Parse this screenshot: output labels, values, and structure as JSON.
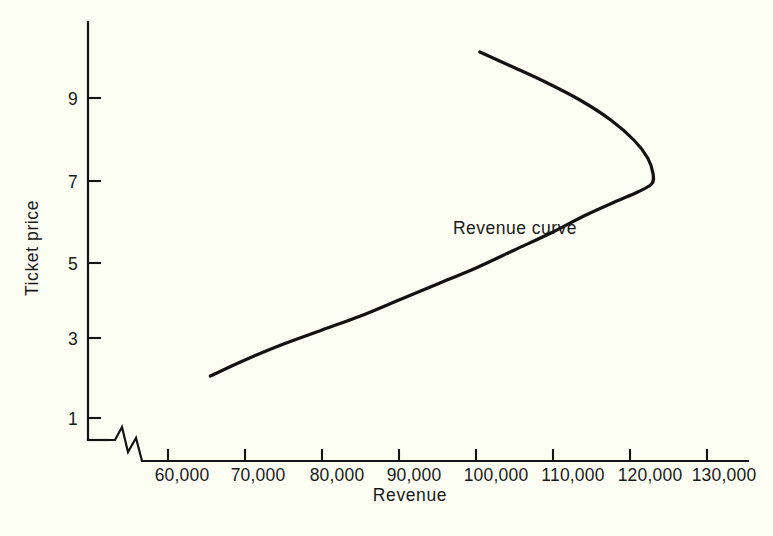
{
  "chart_data": {
    "type": "line",
    "title": "",
    "xlabel": "Revenue",
    "ylabel": "Ticket price",
    "x_tick_labels": [
      "60,000",
      "70,000",
      "80,000",
      "90,000",
      "100,000",
      "110,000",
      "120,000",
      "130,000"
    ],
    "x_tick_values": [
      60000,
      70000,
      80000,
      90000,
      100000,
      110000,
      120000,
      130000
    ],
    "y_tick_labels": [
      "1",
      "3",
      "5",
      "7",
      "9"
    ],
    "y_tick_values": [
      1,
      3,
      5,
      7,
      9
    ],
    "xlim": [
      55000,
      135000
    ],
    "ylim": [
      0,
      10.4
    ],
    "grid": false,
    "legend": false,
    "axis_break": true,
    "axis_break_note": "zigzag break on x-axis between origin and 60,000",
    "annotations": [
      {
        "text": "Revenue curve",
        "x": 97000,
        "y": 5.6
      }
    ],
    "series": [
      {
        "name": "Revenue curve",
        "color": "#141210",
        "orientation": "backward-bending",
        "points": [
          {
            "x": 65500,
            "y": 2.05
          },
          {
            "x": 70000,
            "y": 2.45
          },
          {
            "x": 75000,
            "y": 2.85
          },
          {
            "x": 80000,
            "y": 3.2
          },
          {
            "x": 85000,
            "y": 3.55
          },
          {
            "x": 90000,
            "y": 3.95
          },
          {
            "x": 95000,
            "y": 4.35
          },
          {
            "x": 100000,
            "y": 4.75
          },
          {
            "x": 105000,
            "y": 5.2
          },
          {
            "x": 110000,
            "y": 5.65
          },
          {
            "x": 114000,
            "y": 6.05
          },
          {
            "x": 118000,
            "y": 6.4
          },
          {
            "x": 121000,
            "y": 6.65
          },
          {
            "x": 122800,
            "y": 6.85
          },
          {
            "x": 123000,
            "y": 7.1
          },
          {
            "x": 122300,
            "y": 7.5
          },
          {
            "x": 120500,
            "y": 7.95
          },
          {
            "x": 117500,
            "y": 8.45
          },
          {
            "x": 113500,
            "y": 8.95
          },
          {
            "x": 109000,
            "y": 9.4
          },
          {
            "x": 104500,
            "y": 9.8
          },
          {
            "x": 100500,
            "y": 10.15
          }
        ]
      }
    ]
  },
  "figure": {
    "background_color": "#fdfef3",
    "axis_color": "#131313",
    "curve_color": "#141210"
  }
}
